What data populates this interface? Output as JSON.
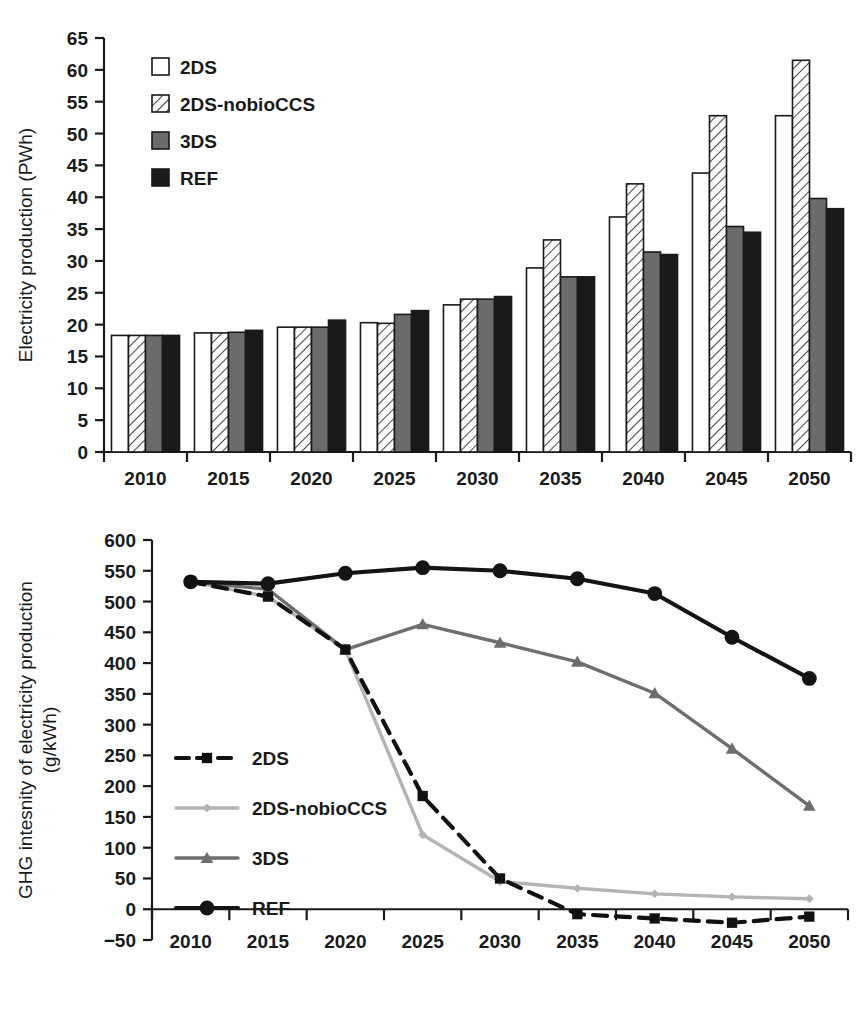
{
  "figure": {
    "panels": [
      "electricity-production-bar-chart",
      "ghg-intensity-line-chart"
    ]
  },
  "colors": {
    "series_2ds": "#ffffff",
    "series_2ds_nobioccs": "#f2f2f2",
    "series_3ds": "#6b6b6b",
    "series_ref": "#1a1a1a",
    "line_2ds": "#111111",
    "line_2ds_nobioccs": "#b4b4b4",
    "line_3ds": "#6e6e6e",
    "line_ref": "#141414",
    "axis": "#1a1a1a",
    "background": "#ffffff"
  },
  "chart_data": [
    {
      "id": "electricity-production",
      "type": "bar",
      "title": "",
      "xlabel": "",
      "ylabel": "Electricity production (PWh)",
      "categories": [
        "2010",
        "2015",
        "2020",
        "2025",
        "2030",
        "2035",
        "2040",
        "2045",
        "2050"
      ],
      "ylim": [
        0,
        65
      ],
      "ytick_step": 5,
      "yticks": [
        0,
        5,
        10,
        15,
        20,
        25,
        30,
        35,
        40,
        45,
        50,
        55,
        60,
        65
      ],
      "grid": false,
      "legend_position": "top-left-inside",
      "series": [
        {
          "name": "2DS",
          "fill": "#ffffff",
          "pattern": "solid-white",
          "values": [
            18.3,
            18.7,
            19.6,
            20.3,
            23.1,
            28.9,
            36.9,
            43.8,
            52.8
          ]
        },
        {
          "name": "2DS-nobioCCS",
          "fill": "#f2f2f2",
          "pattern": "diagonal-hatch",
          "values": [
            18.3,
            18.7,
            19.6,
            20.2,
            24.0,
            33.3,
            42.1,
            52.8,
            61.5
          ]
        },
        {
          "name": "3DS",
          "fill": "#6b6b6b",
          "pattern": "solid-gray",
          "values": [
            18.3,
            18.8,
            19.6,
            21.6,
            24.0,
            27.5,
            31.4,
            35.4,
            39.8
          ]
        },
        {
          "name": "REF",
          "fill": "#1a1a1a",
          "pattern": "solid-black",
          "values": [
            18.3,
            19.1,
            20.7,
            22.2,
            24.4,
            27.5,
            31.0,
            34.5,
            38.2
          ]
        }
      ]
    },
    {
      "id": "ghg-intensity",
      "type": "line",
      "title": "",
      "xlabel": "",
      "ylabel": "GHG intesnity of electricity production (g/kWh)",
      "x": [
        "2010",
        "2015",
        "2020",
        "2025",
        "2030",
        "2035",
        "2040",
        "2045",
        "2050"
      ],
      "ylim": [
        -50,
        600
      ],
      "ytick_step": 50,
      "yticks": [
        -50,
        0,
        50,
        100,
        150,
        200,
        250,
        300,
        350,
        400,
        450,
        500,
        550,
        600
      ],
      "grid": false,
      "legend_position": "lower-left-inside",
      "series": [
        {
          "name": "2DS",
          "color": "#111111",
          "marker": "square",
          "dash": "dashed",
          "values": [
            532,
            508,
            422,
            184,
            50,
            -8,
            -15,
            -22,
            -12
          ]
        },
        {
          "name": "2DS-nobioCCS",
          "color": "#b4b4b4",
          "marker": "diamond",
          "dash": "solid",
          "values": [
            532,
            508,
            422,
            121,
            45,
            34,
            25,
            20,
            17
          ]
        },
        {
          "name": "3DS",
          "color": "#6e6e6e",
          "marker": "triangle",
          "dash": "solid",
          "values": [
            532,
            520,
            422,
            463,
            433,
            402,
            351,
            261,
            168
          ]
        },
        {
          "name": "REF",
          "color": "#141414",
          "marker": "circle",
          "dash": "solid",
          "values": [
            532,
            529,
            546,
            555,
            550,
            537,
            513,
            442,
            375
          ]
        }
      ]
    }
  ]
}
